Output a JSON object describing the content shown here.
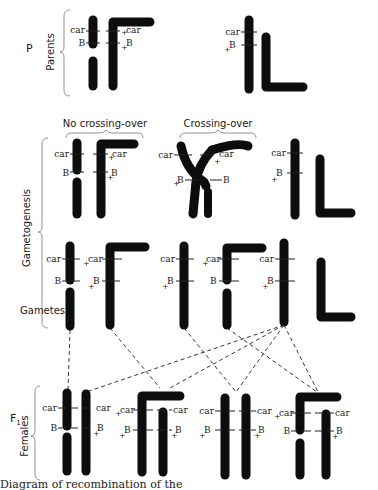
{
  "rows": {
    "p": {
      "generation_label": "P",
      "group_label": "Parents"
    },
    "gametogenesis": {
      "group_label": "Gametogenesis"
    },
    "gametes": {
      "group_label": "Gametes"
    },
    "f1": {
      "generation_label": "F",
      "generation_subscript": "1",
      "group_label": "Females"
    }
  },
  "headings": {
    "no_crossing_over": "No crossing-over",
    "crossing_over": "Crossing-over"
  },
  "loci": {
    "car": "car",
    "B": "B",
    "wild_marker": "+"
  },
  "caption": "Diagram of recombination of the",
  "colors": {
    "chromosome": "#0d0d0d",
    "text": "#1a1a1a",
    "background": "#ffffff"
  }
}
